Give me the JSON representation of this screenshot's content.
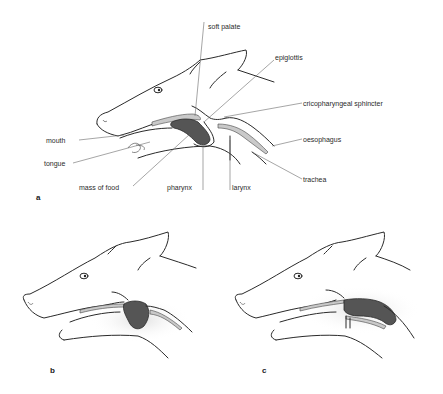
{
  "figure": {
    "panels": [
      {
        "id": "a",
        "label": "a",
        "annotations": {
          "soft_palate": "soft palate",
          "epiglottis": "epiglottis",
          "cricopharyngeal_sphincter": "cricopharyngeal sphincter",
          "mouth": "mouth",
          "oesophagus": "oesophagus",
          "tongue": "tongue",
          "trachea": "trachea",
          "mass_of_food": "mass of food",
          "pharynx": "pharynx",
          "larynx": "larynx"
        }
      },
      {
        "id": "b",
        "label": "b"
      },
      {
        "id": "c",
        "label": "c"
      }
    ],
    "colors": {
      "food": "#555555",
      "outline": "#2a2a2a",
      "tube": "#c9c9c9"
    }
  }
}
